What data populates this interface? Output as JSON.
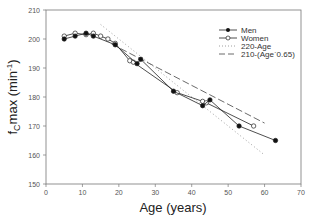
{
  "chart_data": {
    "type": "line",
    "title": "",
    "xlabel": "Age (years)",
    "ylabel": "f_C max (min^-1)",
    "ylabel_parts": {
      "main": "f",
      "sub": "C",
      "rest": "max (min",
      "sup": "-1",
      "close": ")"
    },
    "xlim": [
      0,
      70
    ],
    "ylim": [
      150,
      210
    ],
    "xticks": [
      0,
      10,
      20,
      30,
      40,
      50,
      60,
      70
    ],
    "yticks": [
      150,
      160,
      170,
      180,
      190,
      200,
      210
    ],
    "grid": false,
    "legend_position": "upper right",
    "series": [
      {
        "name": "Men",
        "style": "solid-line-filled-circle",
        "x": [
          5,
          8,
          11,
          13,
          19,
          25,
          26,
          35,
          43,
          45,
          53,
          63
        ],
        "y": [
          200,
          201,
          202,
          201,
          198,
          191.5,
          193,
          182,
          177,
          179,
          170,
          165
        ]
      },
      {
        "name": "Women",
        "style": "solid-line-open-circle",
        "x": [
          5,
          8,
          11,
          13,
          15,
          17,
          19,
          23,
          24,
          36,
          43,
          44,
          57
        ],
        "y": [
          201,
          202,
          201.5,
          202,
          201,
          200,
          198.5,
          192.5,
          192,
          181.5,
          178.5,
          178,
          170
        ]
      },
      {
        "name": "220-Age",
        "style": "dotted",
        "x": [
          15,
          60
        ],
        "y": [
          205,
          160
        ]
      },
      {
        "name": "210-(Age`0.65)",
        "style": "dashed",
        "x": [
          18,
          60
        ],
        "y": [
          198.3,
          171
        ]
      }
    ]
  },
  "legend": {
    "items": [
      "Men",
      "Women",
      "220-Age",
      "210-(Age`0.65)"
    ]
  },
  "colors": {
    "axis": "#555555",
    "series": "#222222",
    "reference_lines": "#888888"
  }
}
